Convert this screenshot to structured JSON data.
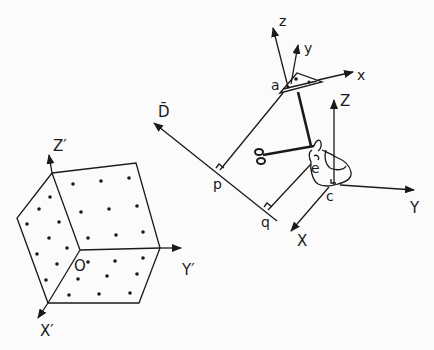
{
  "figure": {
    "colors": {
      "ink": "#1a1a1a",
      "background": "#fbfbfb"
    }
  },
  "cube": {
    "axes": {
      "z_label": "Z′",
      "y_label": "Y′",
      "x_label": "X′",
      "origin_label": "O"
    }
  },
  "tool_frame": {
    "z_label": "z",
    "y_label": "y",
    "x_label": "x",
    "point_label": "a"
  },
  "world_frame": {
    "z_label": "Z",
    "y_label": "Y",
    "x_label": "X",
    "origin_label": "c"
  },
  "direction": {
    "vector_label": "D̄",
    "p_label": "p",
    "q_label": "q"
  },
  "hand": {
    "eye_label": "e"
  }
}
